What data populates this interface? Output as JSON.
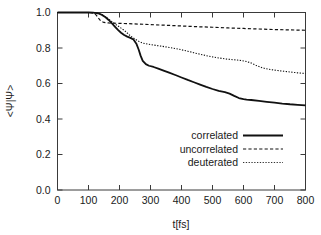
{
  "chart_data": {
    "type": "line",
    "title": "",
    "subtitle": "",
    "xlabel": "t[fs]",
    "ylabel": "<Ψ|Ψ>",
    "xlim": [
      0,
      800
    ],
    "ylim": [
      0.0,
      1.0
    ],
    "xticks": [
      0,
      100,
      200,
      300,
      400,
      500,
      600,
      700,
      800
    ],
    "xtick_labels": [
      "0",
      "100",
      "200",
      "300",
      "400",
      "500",
      "600",
      "700",
      "800"
    ],
    "yticks": [
      0.0,
      0.2,
      0.4,
      0.6,
      0.8,
      1.0
    ],
    "ytick_labels": [
      "0.0",
      "0.2",
      "0.4",
      "0.6",
      "0.8",
      "1.0"
    ],
    "grid": false,
    "legend_position": "lower-right-inside",
    "series": [
      {
        "name": "correlated",
        "style": "solid",
        "color": "#111111",
        "width": 1.8,
        "x": [
          0,
          20,
          40,
          60,
          80,
          100,
          115,
          125,
          135,
          145,
          155,
          165,
          175,
          185,
          195,
          205,
          215,
          225,
          235,
          245,
          255,
          262,
          268,
          275,
          285,
          295,
          310,
          325,
          340,
          360,
          380,
          400,
          420,
          440,
          460,
          480,
          500,
          520,
          540,
          555,
          570,
          585,
          600,
          610,
          625,
          650,
          675,
          700,
          725,
          750,
          775,
          800
        ],
        "y": [
          1.0,
          1.0,
          1.0,
          1.0,
          1.0,
          1.0,
          0.999,
          0.997,
          0.993,
          0.985,
          0.973,
          0.958,
          0.94,
          0.921,
          0.902,
          0.886,
          0.873,
          0.864,
          0.857,
          0.848,
          0.822,
          0.79,
          0.757,
          0.728,
          0.709,
          0.7,
          0.693,
          0.684,
          0.674,
          0.661,
          0.648,
          0.634,
          0.62,
          0.607,
          0.594,
          0.581,
          0.569,
          0.558,
          0.551,
          0.543,
          0.53,
          0.518,
          0.512,
          0.509,
          0.507,
          0.502,
          0.497,
          0.492,
          0.487,
          0.483,
          0.48,
          0.477
        ]
      },
      {
        "name": "uncorrelated",
        "style": "dashed",
        "color": "#111111",
        "width": 1.2,
        "x": [
          0,
          20,
          40,
          60,
          80,
          100,
          110,
          118,
          125,
          132,
          140,
          150,
          165,
          180,
          200,
          230,
          260,
          300,
          350,
          400,
          450,
          500,
          550,
          600,
          650,
          700,
          750,
          800
        ],
        "y": [
          1.0,
          1.0,
          1.0,
          1.0,
          1.0,
          1.0,
          0.999,
          0.995,
          0.985,
          0.968,
          0.952,
          0.944,
          0.941,
          0.94,
          0.939,
          0.937,
          0.935,
          0.932,
          0.928,
          0.924,
          0.92,
          0.917,
          0.913,
          0.91,
          0.907,
          0.904,
          0.902,
          0.9
        ]
      },
      {
        "name": "deuterated",
        "style": "dotted",
        "color": "#333333",
        "width": 1.1,
        "x": [
          0,
          20,
          40,
          60,
          80,
          100,
          115,
          125,
          135,
          145,
          155,
          165,
          175,
          185,
          195,
          205,
          215,
          222,
          230,
          240,
          250,
          262,
          275,
          290,
          305,
          320,
          340,
          360,
          380,
          400,
          420,
          440,
          460,
          480,
          500,
          520,
          540,
          560,
          580,
          595,
          610,
          625,
          640,
          655,
          670,
          690,
          710,
          730,
          750,
          775,
          800
        ],
        "y": [
          1.0,
          1.0,
          1.0,
          1.0,
          1.0,
          1.0,
          0.999,
          0.997,
          0.993,
          0.986,
          0.975,
          0.963,
          0.949,
          0.936,
          0.924,
          0.912,
          0.9,
          0.889,
          0.876,
          0.862,
          0.85,
          0.838,
          0.828,
          0.822,
          0.818,
          0.814,
          0.809,
          0.803,
          0.797,
          0.79,
          0.782,
          0.773,
          0.765,
          0.757,
          0.75,
          0.744,
          0.739,
          0.735,
          0.732,
          0.729,
          0.724,
          0.715,
          0.703,
          0.692,
          0.684,
          0.678,
          0.673,
          0.669,
          0.665,
          0.66,
          0.656
        ]
      }
    ]
  },
  "legend": {
    "entries": [
      {
        "label": "correlated",
        "style": "solid"
      },
      {
        "label": "uncorrelated",
        "style": "dashed"
      },
      {
        "label": "deuterated",
        "style": "dotted"
      }
    ]
  },
  "colors": {
    "background": "#ffffff",
    "axis": "#3a3a3a",
    "text": "#1a1a1a",
    "correlated": "#111111",
    "uncorrelated": "#111111",
    "deuterated": "#333333"
  }
}
